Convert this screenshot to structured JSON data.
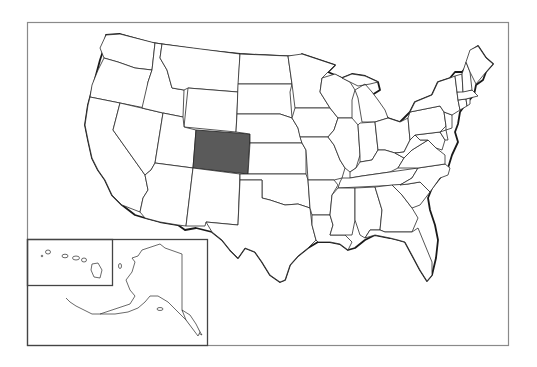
{
  "map": {
    "type": "outline-map",
    "subject": "United States",
    "highlighted_state": "Colorado",
    "colors": {
      "highlight_fill": "#5a5a5a",
      "state_fill": "#ffffff",
      "border": "#1a1a1a",
      "frame": "#8a8a8a"
    },
    "insets": [
      "Hawaii",
      "Alaska"
    ],
    "states_shown": [
      "Washington",
      "Oregon",
      "California",
      "Nevada",
      "Idaho",
      "Montana",
      "Wyoming",
      "Utah",
      "Arizona",
      "Colorado",
      "New Mexico",
      "North Dakota",
      "South Dakota",
      "Nebraska",
      "Kansas",
      "Oklahoma",
      "Texas",
      "Minnesota",
      "Iowa",
      "Missouri",
      "Arkansas",
      "Louisiana",
      "Wisconsin",
      "Illinois",
      "Michigan",
      "Indiana",
      "Ohio",
      "Kentucky",
      "Tennessee",
      "Mississippi",
      "Alabama",
      "Georgia",
      "Florida",
      "South Carolina",
      "North Carolina",
      "Virginia",
      "West Virginia",
      "Maryland",
      "Delaware",
      "Pennsylvania",
      "New Jersey",
      "New York",
      "Connecticut",
      "Rhode Island",
      "Massachusetts",
      "Vermont",
      "New Hampshire",
      "Maine",
      "Alaska",
      "Hawaii"
    ]
  }
}
